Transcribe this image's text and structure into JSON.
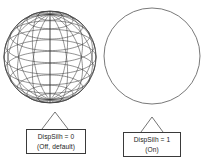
{
  "figure": {
    "background_color": "#ffffff",
    "line_color": "#3a3a3a",
    "text_color": "#1a1a1a"
  },
  "left_graphic": {
    "name": "wireframe-sphere",
    "description": "Sphere drawn with visible hidden wireframe mesh (latitude and longitude lines, silhouette off)",
    "center_x": 50,
    "center_y": 57,
    "radius": 46,
    "meridians": 16,
    "parallels": 12,
    "pole_tilt_deg": 22
  },
  "right_graphic": {
    "name": "silhouette-circle",
    "description": "Sphere drawn as plain silhouette outline only (silhouette on)",
    "center_x": 152,
    "center_y": 56,
    "radius": 48
  },
  "callouts": {
    "left": {
      "line1": "DispSilh = 0",
      "line2": "(Off, default)",
      "pointer_apex_x": 55,
      "pointer_apex_y": 112
    },
    "right": {
      "line1": "DispSilh = 1",
      "line2": "(On)",
      "pointer_apex_x": 152,
      "pointer_apex_y": 117
    }
  }
}
